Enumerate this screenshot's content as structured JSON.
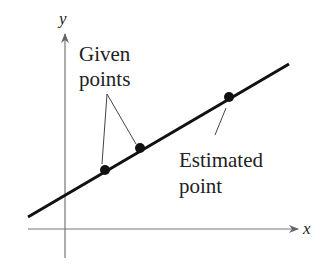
{
  "diagram": {
    "axes": {
      "x_label": "x",
      "y_label": "y"
    },
    "annotations": {
      "given_line1": "Given",
      "given_line2": "points",
      "estimated_line1": "Estimated",
      "estimated_line2": "point"
    },
    "points": [
      {
        "role": "given",
        "x": 105,
        "y": 170
      },
      {
        "role": "given",
        "x": 140,
        "y": 148
      },
      {
        "role": "estimated",
        "x": 229,
        "y": 97
      }
    ],
    "colors": {
      "axis": "#777777",
      "line": "#111111",
      "text": "#222222"
    }
  }
}
